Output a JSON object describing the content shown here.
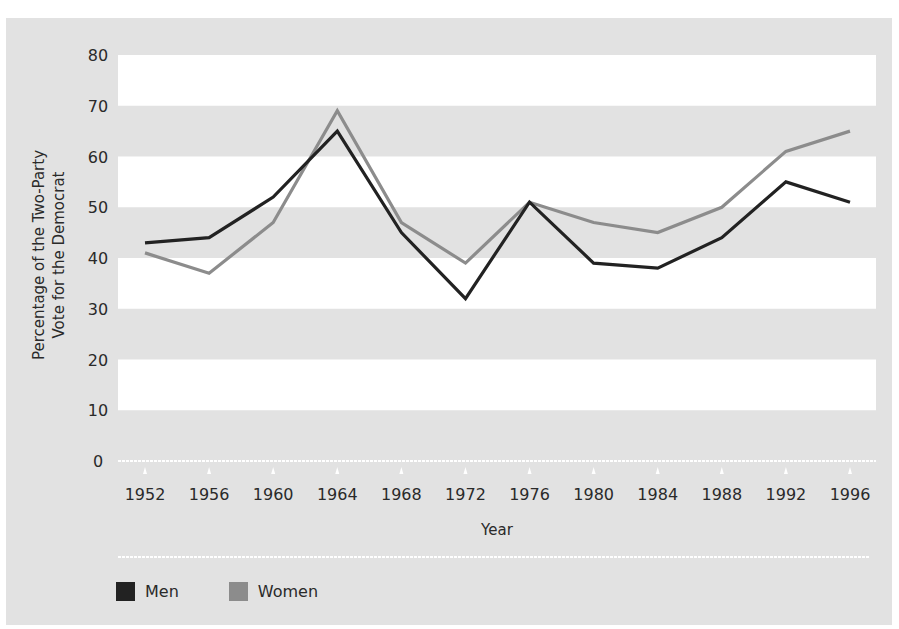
{
  "chart_data": {
    "type": "line",
    "title": "",
    "xlabel": "Year",
    "ylabel": "Percentage of the Two-Party Vote for the Democrat",
    "ylabel_lines": [
      "Percentage of the Two-Party",
      "Vote for the Democrat"
    ],
    "ylim": [
      0,
      80
    ],
    "yticks": [
      0,
      10,
      20,
      30,
      40,
      50,
      60,
      70,
      80
    ],
    "x": [
      "1952",
      "1956",
      "1960",
      "1964",
      "1968",
      "1972",
      "1976",
      "1980",
      "1984",
      "1988",
      "1992",
      "1996"
    ],
    "series": [
      {
        "name": "Men",
        "color": "#222222",
        "values": [
          43,
          44,
          52,
          65,
          45,
          32,
          51,
          39,
          38,
          44,
          55,
          51
        ]
      },
      {
        "name": "Women",
        "color": "#8c8c8c",
        "values": [
          41,
          37,
          47,
          69,
          47,
          39,
          51,
          47,
          45,
          50,
          61,
          65
        ]
      }
    ],
    "grid": "alternating horizontal bands",
    "legend_position": "bottom-left"
  },
  "legend": {
    "men_label": "Men",
    "women_label": "Women"
  },
  "colors": {
    "background": "#e2e2e2",
    "band": "#ffffff",
    "men": "#222222",
    "women": "#8c8c8c"
  }
}
